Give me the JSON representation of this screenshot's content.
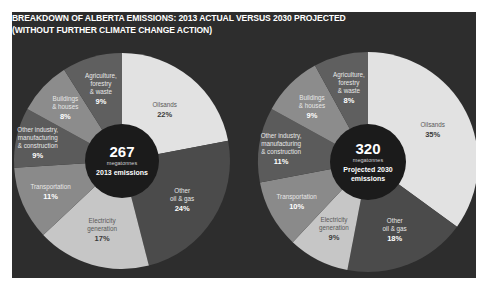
{
  "title": {
    "line1": "BREAKDOWN OF ALBERTA EMISSIONS: 2013 ACTUAL VERSUS 2030 PROJECTED",
    "line2": "(WITHOUT FURTHER CLIMATE CHANGE ACTION)"
  },
  "colors": {
    "background": "#2d2d2d",
    "center": "#1b1b1b",
    "oilsands": "#e2e2e2",
    "other_oil_gas": "#4b4b4b",
    "electricity": "#c6c6c6",
    "transportation": "#8a8a8a",
    "other_industry": "#5b5b5b",
    "buildings": "#8c8c8c",
    "agriculture": "#5f5f5f"
  },
  "chart_data": [
    {
      "type": "pie",
      "title": "2013 emissions",
      "center_value": "267",
      "center_unit": "megatonnes",
      "center_caption": [
        "2013 emissions"
      ],
      "categories": [
        "Oilsands",
        "Other oil & gas",
        "Electricity generation",
        "Transportation",
        "Other industry, manufacturing & construction",
        "Buildings & houses",
        "Agriculture, forestry & waste"
      ],
      "values": [
        22,
        24,
        17,
        11,
        9,
        8,
        9
      ],
      "unit": "%",
      "labels": [
        [
          "Oilsands"
        ],
        [
          "Other",
          "oil & gas"
        ],
        [
          "Electricity",
          "generation"
        ],
        [
          "Transportation"
        ],
        [
          "Other industry,",
          "manufacturing",
          "& construction"
        ],
        [
          "Buildings",
          "& houses"
        ],
        [
          "Agriculture,",
          "forestry",
          "& waste"
        ]
      ]
    },
    {
      "type": "pie",
      "title": "Projected 2030 emissions",
      "center_value": "320",
      "center_unit": "megatonnes",
      "center_caption": [
        "Projected 2030",
        "emissions"
      ],
      "categories": [
        "Oilsands",
        "Other oil & gas",
        "Electricity generation",
        "Transportation",
        "Other industry, manufacturing & construction",
        "Buildings & houses",
        "Agriculture, forestry & waste"
      ],
      "values": [
        35,
        18,
        9,
        10,
        11,
        9,
        8
      ],
      "unit": "%",
      "labels": [
        [
          "Oilsands"
        ],
        [
          "Other",
          "oil & gas"
        ],
        [
          "Electricity",
          "generation"
        ],
        [
          "Transportation"
        ],
        [
          "Other industry,",
          "manufacturing",
          "& construction"
        ],
        [
          "Buildings",
          "& houses"
        ],
        [
          "Agriculture,",
          "forestry",
          "& waste"
        ]
      ]
    }
  ]
}
